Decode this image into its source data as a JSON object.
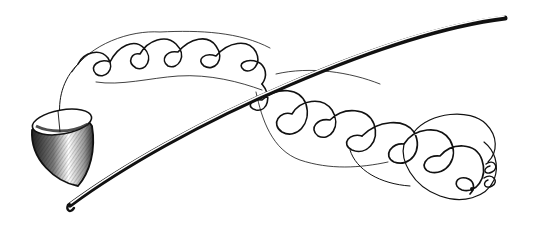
{
  "figure": {
    "style": "black ink line drawing on white",
    "colors": {
      "background": "#ffffff",
      "ink": "#111111",
      "shade": "#555555"
    },
    "elements": {
      "stem": "long slender curved stem running from lower-left to upper-right",
      "cup": "cup/cone-shaped object at lower-left, hatched shading",
      "trace": "continuous looping spiral line starting at the cup and ending in a dot at lower-right",
      "end_dot": "small dot marking end of trace"
    }
  }
}
